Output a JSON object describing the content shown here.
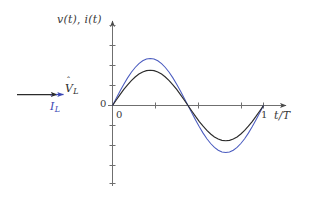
{
  "figure": {
    "background_color": "#ffffff",
    "axis_color": "#4a4a4a",
    "text_color": "#3a3a3a"
  },
  "phasor": {
    "voltage": {
      "label_base": "V",
      "label_hat": "ˆ",
      "label_sub": "L",
      "color": "#2b2b2b",
      "direction": "right"
    },
    "current": {
      "label_base": "I",
      "label_hat": "ˆ",
      "label_sub": "L",
      "color": "#3a46b4",
      "direction": "right"
    }
  },
  "chart_data": {
    "type": "line",
    "title": "",
    "xlabel": "t/T",
    "ylabel": "v(t), i(t)",
    "xlim": [
      -0.06,
      1.12
    ],
    "ylim": [
      -1.35,
      1.35
    ],
    "grid": false,
    "legend": "none",
    "x_ticks": [
      0,
      0.25,
      0.5,
      0.75,
      1
    ],
    "x_tick_labels": [
      "0",
      "",
      "",
      "",
      "1"
    ],
    "y_ticks": [
      -1.2,
      -0.9,
      -0.6,
      -0.3,
      0,
      0.3,
      0.6,
      0.9,
      1.2
    ],
    "y_tick_labels": [
      "",
      "",
      "",
      "",
      "0",
      "",
      "",
      "",
      ""
    ],
    "x": [
      0,
      0.025,
      0.05,
      0.075,
      0.1,
      0.125,
      0.15,
      0.175,
      0.2,
      0.225,
      0.25,
      0.275,
      0.3,
      0.325,
      0.35,
      0.375,
      0.4,
      0.425,
      0.45,
      0.475,
      0.5,
      0.525,
      0.55,
      0.575,
      0.6,
      0.625,
      0.65,
      0.675,
      0.7,
      0.725,
      0.75,
      0.775,
      0.8,
      0.825,
      0.85,
      0.875,
      0.9,
      0.925,
      0.95,
      0.975,
      1
    ],
    "series": [
      {
        "name": "i(t)",
        "color": "#4a5bbf",
        "amplitude": 1.0,
        "phase_deg": 0,
        "values": [
          0,
          0.156,
          0.309,
          0.454,
          0.588,
          0.707,
          0.809,
          0.891,
          0.951,
          0.988,
          1.0,
          0.988,
          0.951,
          0.891,
          0.809,
          0.707,
          0.588,
          0.454,
          0.309,
          0.156,
          0,
          -0.156,
          -0.309,
          -0.454,
          -0.588,
          -0.707,
          -0.809,
          -0.891,
          -0.951,
          -0.988,
          -1.0,
          -0.988,
          -0.951,
          -0.891,
          -0.809,
          -0.707,
          -0.588,
          -0.454,
          -0.309,
          -0.156,
          0
        ]
      },
      {
        "name": "v(t)",
        "color": "#2b2b2b",
        "amplitude": 0.75,
        "phase_deg": 0,
        "values": [
          0,
          0.117,
          0.232,
          0.341,
          0.441,
          0.53,
          0.607,
          0.668,
          0.713,
          0.741,
          0.75,
          0.741,
          0.713,
          0.668,
          0.607,
          0.53,
          0.441,
          0.341,
          0.232,
          0.117,
          0,
          -0.117,
          -0.232,
          -0.341,
          -0.441,
          -0.53,
          -0.607,
          -0.668,
          -0.713,
          -0.741,
          -0.75,
          -0.741,
          -0.713,
          -0.668,
          -0.607,
          -0.53,
          -0.441,
          -0.341,
          -0.232,
          -0.117,
          0
        ]
      }
    ]
  },
  "labels": {
    "y_axis": {
      "v_open": "v(t)",
      "comma": ", ",
      "i_open": "i(t)"
    },
    "x_axis": "t/T",
    "origin_y": "0",
    "origin_x": "0",
    "x_end": "1"
  }
}
